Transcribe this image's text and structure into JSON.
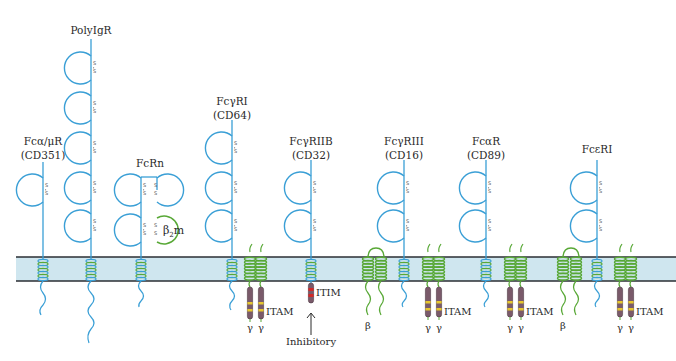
{
  "colors": {
    "receptor_blue": "#3a9fd6",
    "green_chain": "#58a836",
    "membrane_fill": "#cfe6ef",
    "membrane_border": "#2a2e33",
    "tail_purple": "#7a5a6a",
    "itam_yellow": "#e6c62e",
    "itim_red": "#d02a2a",
    "text": "#2a2a2a"
  },
  "receptors": [
    {
      "id": "fca-mur",
      "name": "Fcα/μR",
      "alias": "(CD351)",
      "domains": 1
    },
    {
      "id": "polyigr",
      "name": "PolyIgR",
      "alias": "",
      "domains": 5
    },
    {
      "id": "fcrn",
      "name": "FcRn",
      "alias": "",
      "domains": 4,
      "extra": "β₂m"
    },
    {
      "id": "fcgri",
      "name": "FcγRI",
      "alias": "(CD64)",
      "domains": 3
    },
    {
      "id": "fcgriib",
      "name": "FcγRIIB",
      "alias": "(CD32)",
      "domains": 2
    },
    {
      "id": "fcgriii",
      "name": "FcγRIII",
      "alias": "(CD16)",
      "domains": 2
    },
    {
      "id": "fcar",
      "name": "FcαR",
      "alias": "(CD89)",
      "domains": 2
    },
    {
      "id": "fceri",
      "name": "FcεRI",
      "alias": "",
      "domains": 2
    }
  ],
  "labels": {
    "b2m_beta": "β",
    "b2m_sub": "2",
    "b2m_m": "m",
    "itam": "ITAM",
    "itim": "ITIM",
    "inhibitory": "Inhibitory",
    "gamma": "γ",
    "beta": "β",
    "disulfide": "S"
  },
  "itam_labels": [
    {
      "x": 272,
      "y": 333,
      "text": "ITAM"
    },
    {
      "x": 445,
      "y": 311,
      "text": "ITAM"
    },
    {
      "x": 526,
      "y": 311,
      "text": "ITAM"
    },
    {
      "x": 636,
      "y": 311,
      "text": "ITAM"
    }
  ],
  "gamma_labels": [
    {
      "x": 249,
      "y": 350
    },
    {
      "x": 261,
      "y": 350
    },
    {
      "x": 427,
      "y": 322
    },
    {
      "x": 439,
      "y": 322
    },
    {
      "x": 509,
      "y": 322
    },
    {
      "x": 521,
      "y": 322
    },
    {
      "x": 620,
      "y": 322
    },
    {
      "x": 632,
      "y": 322
    }
  ],
  "beta_labels": [
    {
      "x": 366,
      "y": 322
    },
    {
      "x": 560,
      "y": 322
    }
  ]
}
